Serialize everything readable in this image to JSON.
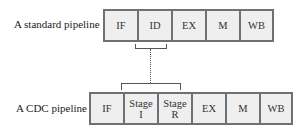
{
  "standard": {
    "label": "A standard pipeline",
    "stages": [
      "IF",
      "ID",
      "EX",
      "M",
      "WB"
    ]
  },
  "cdc": {
    "label": "A CDC pipeline",
    "stages": [
      {
        "l1": "IF",
        "l2": ""
      },
      {
        "l1": "Stage",
        "l2": "I"
      },
      {
        "l1": "Stage",
        "l2": "R"
      },
      {
        "l1": "EX",
        "l2": ""
      },
      {
        "l1": "M",
        "l2": ""
      },
      {
        "l1": "WB",
        "l2": ""
      }
    ]
  }
}
